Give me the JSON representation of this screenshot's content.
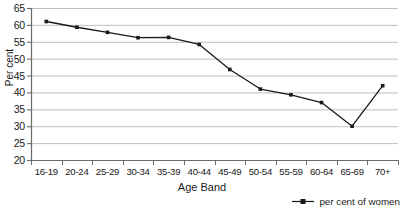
{
  "chart_data": {
    "type": "line",
    "title": "",
    "subtitle": "",
    "xlabel": "Age Band",
    "ylabel": "Per cent",
    "categories": [
      "16-19",
      "20-24",
      "25-29",
      "30-34",
      "35-39",
      "40-44",
      "45-49",
      "50-54",
      "55-59",
      "60-64",
      "65-69",
      "70+"
    ],
    "series": [
      {
        "name": "per cent of women",
        "values": [
          61.0,
          59.3,
          57.8,
          56.2,
          56.3,
          54.2,
          46.8,
          41.0,
          39.3,
          37.0,
          30.0,
          42.0
        ]
      }
    ],
    "ylim": [
      20,
      65
    ],
    "yticks": [
      20,
      25,
      30,
      35,
      40,
      45,
      50,
      55,
      60,
      65
    ],
    "ytick_labels": [
      "20",
      "25",
      "30",
      "35",
      "40",
      "45",
      "50",
      "55",
      "60",
      "65"
    ],
    "grid": "horizontal",
    "legend_position": "bottom-right",
    "line_color": "#1a1a1a",
    "marker": "square",
    "grid_color": "#b8b8b8",
    "axis_color": "#6b6b6b",
    "background": "#ffffff"
  },
  "legend": {
    "entries": [
      {
        "label": "per cent of women",
        "marker": "line-with-point-marker"
      }
    ]
  },
  "axes": {
    "x_title": "Age Band",
    "y_title": "Per cent"
  }
}
